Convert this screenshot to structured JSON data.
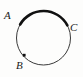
{
  "figure": {
    "name": "circle-with-bold-arc",
    "width": 83,
    "height": 77,
    "background_color": "#fdfdfc",
    "stroke_color": "#1a1a1a",
    "thin_stroke_color": "#3a3a3a"
  },
  "circle": {
    "center_x": 43.5,
    "center_y": 38,
    "radius": 27,
    "thin_stroke_width": 1,
    "bold_stroke_width": 2.6
  },
  "bold_arc": {
    "name": "arc-A-to-C",
    "from_point": "A",
    "to_point": "C",
    "start_angle_deg": 150,
    "end_angle_deg": 28,
    "direction": "clockwise-over-top",
    "stroke_color": "#111111"
  },
  "markers": [
    {
      "id": "B",
      "shape": "square",
      "x": 24,
      "y": 55,
      "size": 2.6,
      "fill": "#111111"
    }
  ],
  "labels": [
    {
      "id": "A",
      "text": "A",
      "x": 4,
      "y": 10
    },
    {
      "id": "C",
      "text": "C",
      "x": 70,
      "y": 22
    },
    {
      "id": "B",
      "text": "B",
      "x": 16,
      "y": 60
    }
  ]
}
